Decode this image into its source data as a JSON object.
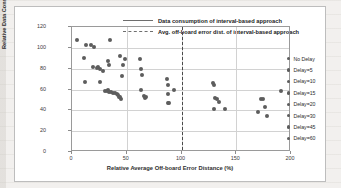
{
  "chart_data": {
    "type": "scatter",
    "title": "",
    "xlabel": "Relative Average Off-board Error Distance (%)",
    "ylabel": "Relative Data Consumption (%)",
    "xlim": [
      0,
      200
    ],
    "ylim": [
      0,
      120
    ],
    "xticks": [
      0,
      50,
      100,
      150,
      200
    ],
    "yticks": [
      0,
      20,
      40,
      60,
      80,
      100,
      120
    ],
    "grid": true,
    "legend_position": "right",
    "annotations": [
      {
        "type": "vertical-dashed-line",
        "x": 100
      }
    ],
    "line_legend": [
      {
        "key": "solid",
        "label": "Data consumption of interval-based approach"
      },
      {
        "key": "dashed",
        "label": "Avg. off-board error dist. of interval-based approach"
      }
    ],
    "series": [
      {
        "name": "No Delay",
        "points": [
          [
            5,
            108
          ],
          [
            11,
            90
          ],
          [
            13,
            103
          ],
          [
            17,
            103
          ],
          [
            20,
            101
          ]
        ]
      },
      {
        "name": "Delay=5",
        "points": [
          [
            12,
            67
          ],
          [
            19,
            82
          ],
          [
            23,
            81
          ],
          [
            24,
            82
          ],
          [
            26,
            80
          ],
          [
            28,
            78
          ]
        ]
      },
      {
        "name": "Delay=10",
        "points": [
          [
            26,
            67
          ],
          [
            30,
            59
          ],
          [
            32,
            59
          ],
          [
            33,
            60
          ],
          [
            34,
            58
          ],
          [
            36,
            58
          ],
          [
            33,
            87
          ],
          [
            34,
            84
          ],
          [
            35,
            108
          ],
          [
            37,
            57
          ]
        ]
      },
      {
        "name": "Delay=15",
        "points": [
          [
            39,
            57
          ],
          [
            41,
            56
          ],
          [
            42,
            55
          ],
          [
            43,
            53
          ],
          [
            44,
            53
          ],
          [
            45,
            51
          ],
          [
            44,
            92
          ],
          [
            47,
            84
          ],
          [
            46,
            73
          ],
          [
            48,
            89
          ]
        ]
      },
      {
        "name": "Delay=20",
        "points": [
          [
            62,
            89
          ],
          [
            63,
            80
          ],
          [
            64,
            74
          ],
          [
            63,
            60
          ],
          [
            66,
            54
          ],
          [
            67,
            52
          ],
          [
            68,
            53
          ]
        ]
      },
      {
        "name": "Delay=30",
        "points": [
          [
            87,
            70
          ],
          [
            88,
            64
          ],
          [
            88,
            56
          ],
          [
            88,
            47
          ],
          [
            89,
            47
          ],
          [
            93,
            60
          ]
        ]
      },
      {
        "name": "Delay=45",
        "points": [
          [
            129,
            66
          ],
          [
            130,
            64
          ],
          [
            131,
            52
          ],
          [
            132,
            51
          ],
          [
            130,
            41
          ],
          [
            134,
            48
          ],
          [
            140,
            41
          ]
        ]
      },
      {
        "name": "Delay=60",
        "points": [
          [
            170,
            38
          ],
          [
            173,
            51
          ],
          [
            174,
            51
          ],
          [
            176,
            43
          ],
          [
            178,
            35
          ],
          [
            191,
            59
          ]
        ]
      }
    ]
  },
  "axes": {
    "y_tick_labels": [
      "120",
      "100",
      "80",
      "60",
      "40",
      "20",
      "0"
    ],
    "x_tick_labels": [
      "0",
      "50",
      "100",
      "150",
      "200"
    ]
  }
}
